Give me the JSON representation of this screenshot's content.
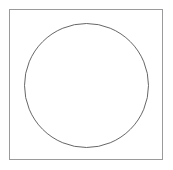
{
  "canvas": {
    "width": 173,
    "height": 170,
    "background_color": "#ffffff"
  },
  "figure": {
    "shapes": [
      {
        "name": "square-outline",
        "type": "rect",
        "x": 9.5,
        "y": 9.5,
        "width": 153,
        "height": 150,
        "stroke_color": "#9a9a9a",
        "stroke_width": 1,
        "fill": "none"
      },
      {
        "name": "circle-outline",
        "type": "circle",
        "cx": 86.5,
        "cy": 85.5,
        "r": 62,
        "stroke_color": "#555555",
        "stroke_width": 0.9,
        "fill": "none"
      }
    ]
  }
}
